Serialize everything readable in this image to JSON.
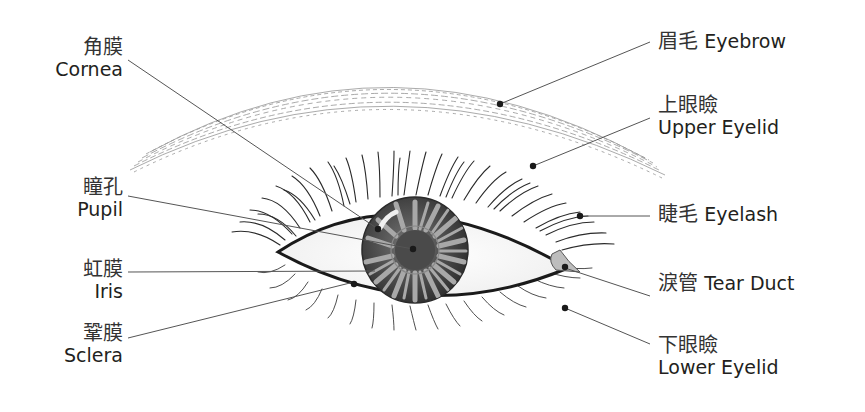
{
  "diagram": {
    "labels": {
      "cornea": {
        "zh": "角膜",
        "en": "Cornea"
      },
      "pupil": {
        "zh": "瞳孔",
        "en": "Pupil"
      },
      "iris": {
        "zh": "虹膜",
        "en": "Iris"
      },
      "sclera": {
        "zh": "鞏膜",
        "en": "Sclera"
      },
      "eyebrow": {
        "zh": "眉毛",
        "en": "Eyebrow"
      },
      "upper_eyelid": {
        "zh": "上眼瞼",
        "en": "Upper Eyelid"
      },
      "eyelash": {
        "zh": "睫毛",
        "en": "Eyelash"
      },
      "tear_duct": {
        "zh": "淚管",
        "en": "Tear Duct"
      },
      "lower_eyelid": {
        "zh": "下眼瞼",
        "en": "Lower Eyelid"
      }
    },
    "colors": {
      "ink": "#231f20",
      "leader": "#555555",
      "iris_dark": "#3a3a3a",
      "iris_light": "#9a9a9a",
      "pupil": "#4a4a4a",
      "sclera": "#f4f4f4",
      "tear_duct": "#bdbdbd"
    }
  }
}
